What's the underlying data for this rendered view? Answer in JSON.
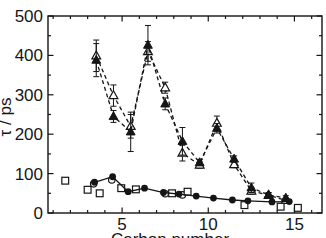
{
  "figure": {
    "background": "#ffffff",
    "ink_color": "#151515"
  },
  "chart_data": {
    "type": "line",
    "title": "",
    "xlabel": "Carbon number",
    "ylabel": "τ / ps",
    "xlim": [
      0.7,
      16.6
    ],
    "ylim": [
      0,
      500
    ],
    "x_major_ticks": [
      5,
      10,
      15
    ],
    "x_minor_step": 1,
    "y_major_ticks": [
      0,
      100,
      200,
      300,
      400,
      500
    ],
    "y_minor_step": 50,
    "grid": false,
    "legend_position": "none",
    "frame": "full-box-inward-ticks",
    "series": [
      {
        "name": "open-triangle-dashed",
        "marker": "triangle-open",
        "line": "dashed",
        "x": [
          3.5,
          4.5,
          5.5,
          6.5,
          7.5,
          8.5,
          9.5,
          10.5,
          11.5,
          12.5,
          13.5,
          14.5
        ],
        "y": [
          399,
          298,
          220,
          410,
          318,
          152,
          122,
          228,
          123,
          56,
          45,
          32
        ],
        "yerr": [
          40,
          27,
          30,
          25,
          14,
          20,
          8,
          18,
          8,
          8,
          6,
          6
        ]
      },
      {
        "name": "filled-triangle-dashed",
        "marker": "triangle-filled",
        "line": "dashed",
        "x": [
          3.5,
          4.5,
          5.5,
          6.5,
          7.5,
          8.5,
          9.5,
          10.5,
          11.5,
          12.5,
          13.5,
          14.5
        ],
        "y": [
          388,
          245,
          206,
          426,
          277,
          182,
          128,
          215,
          137,
          64,
          46,
          38
        ],
        "yerr": [
          42,
          15,
          50,
          50,
          15,
          35,
          8,
          12,
          8,
          12,
          6,
          6
        ]
      },
      {
        "name": "open-circle",
        "marker": "circle-open",
        "line": "none",
        "x": [
          3.35,
          4.4,
          7.5,
          8.5
        ],
        "y": [
          74,
          84,
          49,
          46
        ],
        "yerr": []
      },
      {
        "name": "open-square-scatter",
        "marker": "square-open",
        "line": "none",
        "x": [
          1.7,
          3.0,
          3.7,
          4.95,
          5.8,
          7.9,
          8.8,
          12.1,
          14.2,
          15.2
        ],
        "y": [
          82,
          59,
          50,
          63,
          60,
          50,
          54,
          20,
          16,
          13
        ],
        "yerr": []
      },
      {
        "name": "filled-circle-solid",
        "marker": "circle-filled",
        "line": "solid",
        "x": [
          3.4,
          4.45,
          5.35,
          6.3,
          7.4,
          8.3,
          9.3,
          10.3,
          11.4,
          12.3,
          13.7,
          14.7
        ],
        "y": [
          78,
          92,
          54,
          63,
          52,
          48,
          43,
          38,
          33,
          31,
          28,
          29
        ],
        "yerr": []
      }
    ]
  }
}
